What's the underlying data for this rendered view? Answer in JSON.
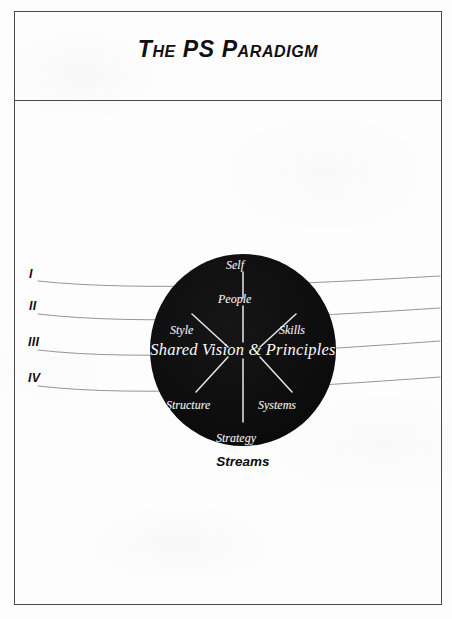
{
  "page": {
    "title": "The PS Paradigm",
    "background_color": "#fdfdfd",
    "frame_color": "#4a4a4a"
  },
  "header": {
    "title": "The PS Paradigm"
  },
  "streams": {
    "caption": "Streams",
    "numerals": [
      {
        "label": "I",
        "x": 29,
        "y": 267,
        "curve_start_y": 281,
        "curve_end_y": 276
      },
      {
        "label": "II",
        "x": 29,
        "y": 299,
        "curve_start_y": 314,
        "curve_end_y": 308
      },
      {
        "label": "III",
        "x": 28,
        "y": 335,
        "curve_start_y": 350,
        "curve_end_y": 341
      },
      {
        "label": "IV",
        "x": 28,
        "y": 371,
        "curve_start_y": 386,
        "curve_end_y": 377
      }
    ]
  },
  "diagram": {
    "center_label": "Shared Vision & Principles",
    "circle": {
      "center_x": 243,
      "center_y": 350,
      "radius_x": 93,
      "radius_y": 96,
      "fill": "#0e0e0e"
    },
    "nodes": [
      {
        "name": "self",
        "label": "Self",
        "x": 226,
        "y": 258
      },
      {
        "name": "people",
        "label": "People",
        "x": 218,
        "y": 292
      },
      {
        "name": "style",
        "label": "Style",
        "x": 170,
        "y": 323
      },
      {
        "name": "skills",
        "label": "Skills",
        "x": 279,
        "y": 323
      },
      {
        "name": "structure",
        "label": "Structure",
        "x": 166,
        "y": 398
      },
      {
        "name": "systems",
        "label": "Systems",
        "x": 258,
        "y": 398
      },
      {
        "name": "strategy",
        "label": "Strategy",
        "x": 216,
        "y": 431
      }
    ],
    "spoke_color": "#e8e8e8",
    "label_color": "#f2f2f2"
  }
}
